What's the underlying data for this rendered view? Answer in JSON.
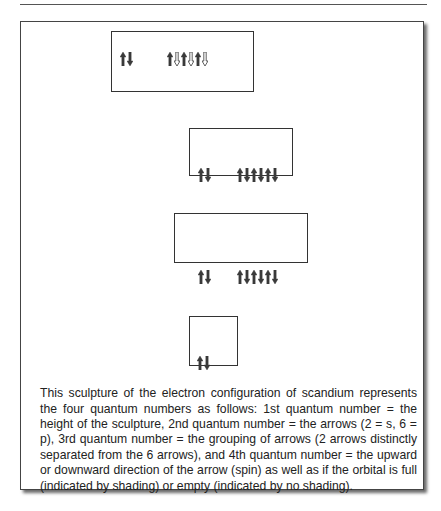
{
  "figure": {
    "caption": "This sculpture of the electron configuration of scandium represents the four quantum numbers as follows: 1st quantum number = the height of the sculpture, 2nd quantum number = the arrows (2 = s, 6 = p), 3rd quantum number = the grouping of arrows (2 arrows distinctly separated from the 6 arrows), and 4th quantum number = the upward or downward direction of the arrow (spin) as well as if the orbital is full (indicated by shading) or empty (indicated by no shading).",
    "levels": [
      {
        "name": "level-1",
        "s": [
          "up-filled",
          "down-filled"
        ],
        "p": [
          "up-filled",
          "down-empty",
          "up-filled",
          "down-empty",
          "up-filled",
          "down-empty"
        ]
      },
      {
        "name": "level-2",
        "s": [
          "up-filled",
          "down-filled"
        ],
        "p": [
          "up-filled",
          "down-filled",
          "up-filled",
          "down-filled",
          "up-filled",
          "down-filled"
        ]
      },
      {
        "name": "level-3",
        "s": [
          "up-filled",
          "down-filled"
        ],
        "p": [
          "up-filled",
          "down-filled",
          "up-filled",
          "down-filled",
          "up-filled",
          "down-filled"
        ]
      },
      {
        "name": "level-4",
        "s": [
          "up-filled",
          "down-filled"
        ],
        "p": []
      }
    ],
    "colors": {
      "arrow_fill": "#3a3a3a",
      "border": "#333333",
      "shadow": "#6b6b6b"
    }
  }
}
